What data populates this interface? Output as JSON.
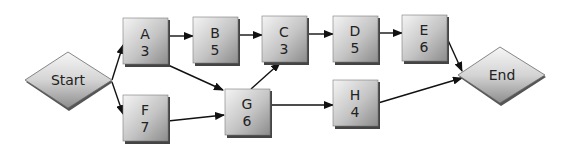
{
  "diagram": {
    "type": "activity-network",
    "start": {
      "id": "start",
      "label": "Start"
    },
    "end": {
      "id": "end",
      "label": "End"
    },
    "nodes": [
      {
        "id": "A",
        "label": "A",
        "duration": "3"
      },
      {
        "id": "B",
        "label": "B",
        "duration": "5"
      },
      {
        "id": "C",
        "label": "C",
        "duration": "3"
      },
      {
        "id": "D",
        "label": "D",
        "duration": "5"
      },
      {
        "id": "E",
        "label": "E",
        "duration": "6"
      },
      {
        "id": "F",
        "label": "F",
        "duration": "7"
      },
      {
        "id": "G",
        "label": "G",
        "duration": "6"
      },
      {
        "id": "H",
        "label": "H",
        "duration": "4"
      }
    ],
    "edges": [
      [
        "Start",
        "A"
      ],
      [
        "Start",
        "F"
      ],
      [
        "A",
        "B"
      ],
      [
        "A",
        "G"
      ],
      [
        "B",
        "C"
      ],
      [
        "C",
        "D"
      ],
      [
        "D",
        "E"
      ],
      [
        "E",
        "End"
      ],
      [
        "F",
        "G"
      ],
      [
        "G",
        "C"
      ],
      [
        "G",
        "H"
      ],
      [
        "H",
        "End"
      ]
    ]
  },
  "colors": {
    "node_light": "#f2f2f2",
    "node_dark": "#8a8a8a",
    "shadow": "#555555",
    "edge": "#111111"
  }
}
